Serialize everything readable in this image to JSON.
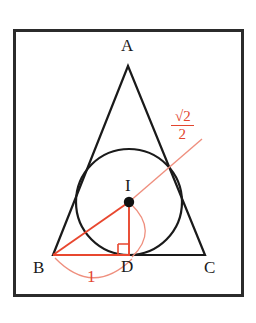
{
  "figure": {
    "kind": "geometry-diagram",
    "colors": {
      "outline": "#1a1a1a",
      "annotation": "#e2452f",
      "annotation_light": "#ef8f7e",
      "background": "#ffffff",
      "frame": "#2b2b2b"
    },
    "frame": {
      "x": 13,
      "y": 29,
      "width": 230,
      "height": 267,
      "stroke_width": 3
    },
    "triangle": {
      "stroke_width": 2,
      "vertices": [
        {
          "name": "A",
          "x": 128,
          "y": 66
        },
        {
          "name": "B",
          "x": 53,
          "y": 255
        },
        {
          "name": "C",
          "x": 205,
          "y": 255
        }
      ]
    },
    "incircle": {
      "center_x": 129,
      "center_y": 202,
      "radius": 53,
      "stroke_width": 2
    },
    "center_point": {
      "x": 129,
      "y": 202,
      "dot_radius": 5
    },
    "tangent_point_d": {
      "x": 129,
      "y": 255
    },
    "tangent_point_ac": {
      "x": 176,
      "y": 177
    },
    "right_angle_marker": {
      "x": 118,
      "y": 243,
      "size": 11
    },
    "segments": [
      {
        "name": "segment-b-to-i",
        "x1": 53,
        "y1": 255,
        "x2": 129,
        "y2": 202
      },
      {
        "name": "segment-i-to-d",
        "x1": 129,
        "y1": 202,
        "x2": 129,
        "y2": 255
      },
      {
        "name": "segment-b-to-d",
        "x1": 53,
        "y1": 255,
        "x2": 129,
        "y2": 255
      },
      {
        "name": "radius-leader-line",
        "x1": 129,
        "y1": 202,
        "x2": 201,
        "y2": 140
      }
    ],
    "arcs": [
      {
        "name": "measure-arc-bd",
        "start_x": 57,
        "start_y": 260,
        "end_x": 131,
        "end_y": 262,
        "sweep_y": 290
      },
      {
        "name": "measure-arc-id",
        "start_x": 131,
        "start_y": 205,
        "end_x": 131,
        "end_y": 258,
        "bulge_x": 157
      }
    ]
  },
  "labels": {
    "vertex_a": {
      "text": "A",
      "x": 122,
      "y": 40
    },
    "vertex_b": {
      "text": "B",
      "x": 36,
      "y": 262
    },
    "vertex_c": {
      "text": "C",
      "x": 207,
      "y": 262
    },
    "vertex_d": {
      "text": "D",
      "x": 122,
      "y": 260
    },
    "center_i": {
      "text": "I",
      "x": 125,
      "y": 178
    },
    "length_bd": {
      "text": "1",
      "x": 87,
      "y": 269
    }
  },
  "fraction_label": {
    "name": "inradius-value",
    "radical_symbol": "√",
    "numerator": "2",
    "denominator": "2",
    "full_text": "√2/2",
    "x": 172,
    "y": 110
  }
}
